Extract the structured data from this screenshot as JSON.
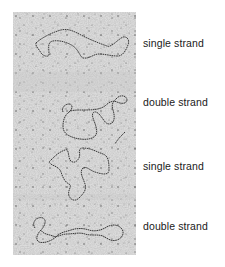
{
  "figure": {
    "panels": [
      {
        "label": "single strand",
        "top": 37
      },
      {
        "label": "double strand",
        "top": 96
      },
      {
        "label": "single strand",
        "top": 160
      },
      {
        "label": "double strand",
        "top": 220
      }
    ],
    "colors": {
      "background": "#ffffff",
      "micrograph_base": "#d9d9d9",
      "strand": "#3a3a3a",
      "text": "#1a1a1a"
    }
  }
}
